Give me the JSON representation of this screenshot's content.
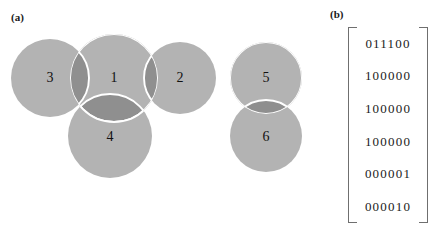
{
  "figure": {
    "panels": [
      {
        "label": "(a)",
        "name": "circle-diagram"
      },
      {
        "label": "(b)",
        "name": "adjacency-matrix"
      }
    ]
  },
  "panel_a": {
    "label": "(a)",
    "fill_color": "#b3b3b3",
    "overlap_color": "#8f8f8f",
    "outline_color": "#ffffff",
    "nodes": [
      {
        "id": "1",
        "label": "1",
        "cx": 114,
        "cy": 78,
        "r": 44
      },
      {
        "id": "2",
        "label": "2",
        "cx": 180,
        "cy": 78,
        "r": 36
      },
      {
        "id": "3",
        "label": "3",
        "cx": 50,
        "cy": 78,
        "r": 39
      },
      {
        "id": "4",
        "label": "4",
        "cx": 110,
        "cy": 136,
        "r": 42
      },
      {
        "id": "5",
        "label": "5",
        "cx": 266,
        "cy": 78,
        "r": 36
      },
      {
        "id": "6",
        "label": "6",
        "cx": 266,
        "cy": 136,
        "r": 36
      }
    ],
    "overlaps": [
      {
        "a": "3",
        "b": "1"
      },
      {
        "a": "1",
        "b": "2"
      },
      {
        "a": "1",
        "b": "4"
      },
      {
        "a": "5",
        "b": "6"
      }
    ]
  },
  "panel_b": {
    "label": "(b)",
    "bracket_color": "#6f6f6f",
    "matrix": [
      "011100",
      "100000",
      "100000",
      "100000",
      "000001",
      "000010"
    ]
  }
}
